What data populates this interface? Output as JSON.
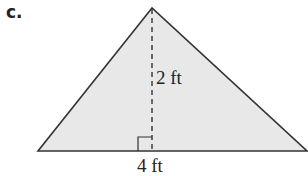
{
  "problem_label": "c.",
  "figure": {
    "shape": "triangle",
    "fill_color": "#e8e8e8",
    "stroke_color": "#333333",
    "height_label": "2 ft",
    "base_label": "4 ft",
    "right_angle_marker": true,
    "height_line_style": "dashed"
  }
}
